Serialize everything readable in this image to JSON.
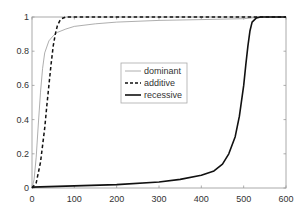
{
  "chart_data": {
    "type": "line",
    "title": "",
    "xlabel": "",
    "ylabel": "",
    "xlim": [
      0,
      600
    ],
    "ylim": [
      0,
      1
    ],
    "grid": false,
    "legend_position": "center",
    "xticks": [
      0,
      100,
      200,
      300,
      400,
      500,
      600
    ],
    "yticks": [
      0,
      0.2,
      0.4,
      0.6,
      0.8,
      1
    ],
    "xtick_labels": [
      "0",
      "100",
      "200",
      "300",
      "400",
      "500",
      "600"
    ],
    "ytick_labels": [
      "0",
      "0.2",
      "0.4",
      "0.6",
      "0.8",
      "1"
    ],
    "series": [
      {
        "name": "dominant",
        "style": "solid-thin",
        "color": "#999999",
        "x": [
          0,
          5,
          10,
          15,
          20,
          25,
          30,
          40,
          50,
          60,
          80,
          100,
          150,
          200,
          300,
          400,
          500,
          540,
          600
        ],
        "y": [
          0.0,
          0.05,
          0.18,
          0.38,
          0.56,
          0.7,
          0.79,
          0.86,
          0.89,
          0.91,
          0.93,
          0.945,
          0.96,
          0.97,
          0.98,
          0.985,
          0.99,
          1.0,
          1.0
        ]
      },
      {
        "name": "additive",
        "style": "dashed",
        "color": "#111111",
        "x": [
          0,
          10,
          20,
          30,
          35,
          40,
          45,
          50,
          55,
          60,
          65,
          70,
          80,
          100,
          200,
          300,
          400,
          500,
          600
        ],
        "y": [
          0.0,
          0.03,
          0.15,
          0.35,
          0.48,
          0.6,
          0.72,
          0.83,
          0.9,
          0.95,
          0.975,
          0.99,
          1.0,
          1.0,
          1.0,
          1.0,
          1.0,
          1.0,
          1.0
        ]
      },
      {
        "name": "recessive",
        "style": "solid-thick",
        "color": "#111111",
        "x": [
          0,
          100,
          200,
          300,
          350,
          400,
          430,
          450,
          465,
          480,
          490,
          500,
          505,
          510,
          515,
          520,
          530,
          540,
          600
        ],
        "y": [
          0.005,
          0.012,
          0.02,
          0.035,
          0.05,
          0.075,
          0.1,
          0.14,
          0.2,
          0.3,
          0.42,
          0.6,
          0.72,
          0.83,
          0.92,
          0.97,
          0.995,
          1.0,
          1.0
        ]
      }
    ],
    "legend": [
      "dominant",
      "additive",
      "recessive"
    ]
  }
}
